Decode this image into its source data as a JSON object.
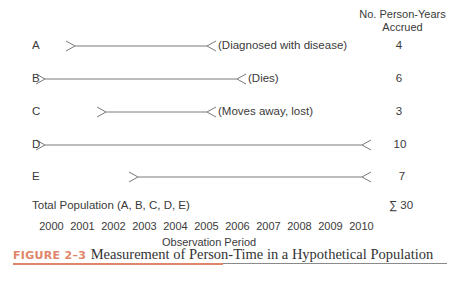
{
  "header": {
    "column_title_line1": "No. Person-Years",
    "column_title_line2": "Accrued"
  },
  "subjects": [
    {
      "label": "A",
      "start_year": 2001,
      "end_year": 2005,
      "annotation": "(Diagnosed with disease)",
      "person_years": "4"
    },
    {
      "label": "B",
      "start_year": 2000,
      "end_year": 2006,
      "annotation": "(Dies)",
      "person_years": "6"
    },
    {
      "label": "C",
      "start_year": 2002,
      "end_year": 2005,
      "annotation": "(Moves away, lost)",
      "person_years": "3"
    },
    {
      "label": "D",
      "start_year": 2000,
      "end_year": 2010,
      "annotation": "",
      "person_years": "10"
    },
    {
      "label": "E",
      "start_year": 2003,
      "end_year": 2010,
      "annotation": "",
      "person_years": "7"
    }
  ],
  "total": {
    "label": "Total Population (A, B, C, D, E)",
    "value": "∑ 30"
  },
  "axis": {
    "years": [
      "2000",
      "2001",
      "2002",
      "2003",
      "2004",
      "2005",
      "2006",
      "2007",
      "2008",
      "2009",
      "2010"
    ],
    "title": "Observation Period"
  },
  "caption": {
    "tag": "FIGURE 2–3",
    "text": "Measurement of Person-Time in a Hypothetical Population",
    "tag_color": "#e0856a",
    "rule_color": "#8a8a8a"
  },
  "colors": {
    "line": "#7a7a7a",
    "text": "#3a3a3a"
  }
}
